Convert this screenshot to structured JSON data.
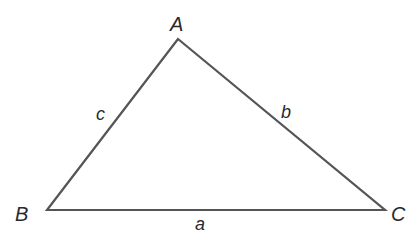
{
  "diagram": {
    "type": "triangle",
    "stroke_color": "#555555",
    "label_color": "#2a2a2a",
    "vertices": {
      "A": {
        "label": "A",
        "x": 178,
        "y": 39
      },
      "B": {
        "label": "B",
        "x": 47,
        "y": 210
      },
      "C": {
        "label": "C",
        "x": 385,
        "y": 210
      }
    },
    "sides": {
      "a": {
        "label": "a",
        "between": "B-C"
      },
      "b": {
        "label": "b",
        "between": "A-C"
      },
      "c": {
        "label": "c",
        "between": "A-B"
      }
    }
  }
}
